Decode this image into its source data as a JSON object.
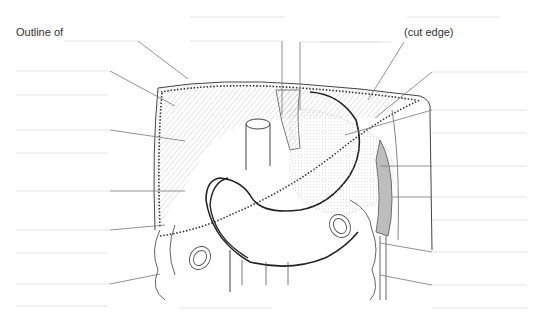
{
  "diagram": {
    "type": "anatomical-labeling-worksheet",
    "labels": [
      {
        "id": "outline",
        "text": "Outline of",
        "x": 16,
        "y": 34
      },
      {
        "id": "cut-edge",
        "text": "(cut edge)",
        "x": 404,
        "y": 33
      }
    ],
    "left_blank_lines": [
      {
        "y": 41,
        "x1": 64,
        "x2": 138,
        "leader_to": [
          188,
          79
        ]
      },
      {
        "y": 71,
        "x1": 16,
        "x2": 110,
        "leader_to": [
          175,
          106
        ]
      },
      {
        "y": 95,
        "x1": 16,
        "x2": 108
      },
      {
        "y": 130,
        "x1": 16,
        "x2": 110,
        "leader_to": [
          185,
          141
        ]
      },
      {
        "y": 153,
        "x1": 16,
        "x2": 108
      },
      {
        "y": 191,
        "x1": 16,
        "x2": 110,
        "leader_to": [
          185,
          191
        ]
      },
      {
        "y": 230,
        "x1": 16,
        "x2": 110,
        "leader_to": [
          165,
          225
        ]
      },
      {
        "y": 253,
        "x1": 16,
        "x2": 108
      },
      {
        "y": 284,
        "x1": 16,
        "x2": 110,
        "leader_to": [
          160,
          274
        ]
      },
      {
        "y": 306,
        "x1": 16,
        "x2": 108
      }
    ],
    "top_blank_lines": [
      {
        "y": 17,
        "x1": 190,
        "x2": 285
      },
      {
        "y": 41,
        "x1": 190,
        "x2": 282,
        "leader_x": 282
      },
      {
        "y": 42,
        "x1": 300,
        "x2": 380,
        "leader_x": 300
      },
      {
        "y": 17,
        "x1": 407,
        "x2": 500
      }
    ],
    "right_blank_lines": [
      {
        "y": 72,
        "x1": 432,
        "x2": 527,
        "leader_from": [
          375,
          120
        ]
      },
      {
        "y": 110,
        "x1": 432,
        "x2": 527,
        "leader_from": [
          345,
          133
        ]
      },
      {
        "y": 133,
        "x1": 432,
        "x2": 527
      },
      {
        "y": 166,
        "x1": 432,
        "x2": 527,
        "leader_from": [
          380,
          166
        ]
      },
      {
        "y": 197,
        "x1": 432,
        "x2": 527,
        "leader_from": [
          395,
          197
        ]
      },
      {
        "y": 220,
        "x1": 432,
        "x2": 527
      },
      {
        "y": 252,
        "x1": 432,
        "x2": 527,
        "leader_from": [
          380,
          243
        ]
      },
      {
        "y": 285,
        "x1": 432,
        "x2": 527,
        "leader_from": [
          380,
          275
        ]
      },
      {
        "y": 308,
        "x1": 432,
        "x2": 527
      }
    ],
    "bottom_blank_lines": [
      {
        "y": 308,
        "x1": 180,
        "x2": 272
      }
    ],
    "colors": {
      "ink": "#222222",
      "leader": "#777777",
      "blank_line": "#e3e3e3",
      "hatch": "#999999",
      "shade": "#bdbdbd"
    }
  }
}
